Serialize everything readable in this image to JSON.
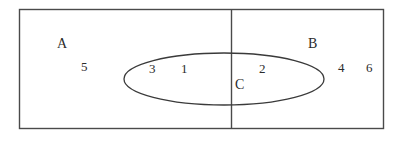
{
  "diagram": {
    "type": "venn-euler-diagram",
    "background_color": "#ffffff",
    "stroke_color": "#4a4a4a",
    "text_color": "#2b2b2b",
    "universe_rect": {
      "x": 19,
      "y": 9,
      "width": 365,
      "height": 120
    },
    "divider_line": {
      "x": 231,
      "y1": 9,
      "y2": 129
    },
    "ellipse": {
      "cx": 224,
      "cy": 79,
      "rx": 100,
      "ry": 26
    },
    "set_labels": [
      {
        "id": "A",
        "text": "A",
        "x": 62,
        "y": 44
      },
      {
        "id": "B",
        "text": "B",
        "x": 313,
        "y": 44
      },
      {
        "id": "C",
        "text": "C",
        "x": 240,
        "y": 85
      }
    ],
    "region_numbers": [
      {
        "id": "n5",
        "text": "5",
        "x": 84,
        "y": 67,
        "region": "A-only"
      },
      {
        "id": "n3",
        "text": "3",
        "x": 152,
        "y": 69,
        "region": "A-and-C"
      },
      {
        "id": "n1",
        "text": "1",
        "x": 184,
        "y": 69,
        "region": "A-and-C"
      },
      {
        "id": "n2",
        "text": "2",
        "x": 262,
        "y": 69,
        "region": "B-and-C"
      },
      {
        "id": "n4",
        "text": "4",
        "x": 341,
        "y": 68,
        "region": "B-only"
      },
      {
        "id": "n6",
        "text": "6",
        "x": 369,
        "y": 68,
        "region": "B-only"
      }
    ]
  }
}
